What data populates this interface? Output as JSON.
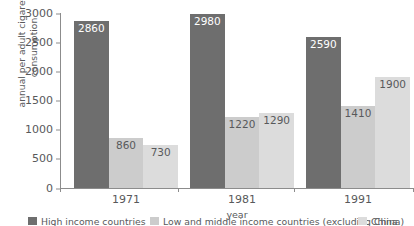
{
  "chart_data": {
    "type": "bar",
    "title": "",
    "subtitle": "",
    "xlabel": "year",
    "ylabel": "annual per adult cigarette\nconsumption",
    "categories": [
      "1971",
      "1981",
      "1991"
    ],
    "series": [
      {
        "name": "High income countries",
        "color": "#6e6e6e",
        "values": [
          2860,
          2980,
          2590
        ]
      },
      {
        "name": "Low and middle income countries (excluding China)",
        "color": "#cccccc",
        "values": [
          860,
          1220,
          1410
        ]
      },
      {
        "name": "China",
        "color": "#dcdcdc",
        "values": [
          730,
          1290,
          1900
        ]
      }
    ],
    "ylim": [
      0,
      3000
    ],
    "yticks": [
      0,
      500,
      1000,
      1500,
      2000,
      2500,
      3000
    ],
    "ytick_labels": [
      "0",
      "500",
      "1000",
      "1500",
      "2000",
      "2500",
      "3000"
    ],
    "grid": false,
    "legend_position": "bottom",
    "value_labels": true,
    "bar_value_labels": [
      [
        "2860",
        "860",
        "730"
      ],
      [
        "2980",
        "1220",
        "1290"
      ],
      [
        "2590",
        "1410",
        "1900"
      ]
    ]
  },
  "axes": {
    "y_title": "annual per adult cigarette\nconsumption",
    "x_title": "year"
  },
  "legend": {
    "items": [
      {
        "label": "High income countries",
        "color": "#6e6e6e"
      },
      {
        "label": "Low and middle income countries (excluding China)",
        "color": "#cccccc"
      },
      {
        "label": "China",
        "color": "#dcdcdc"
      }
    ]
  }
}
